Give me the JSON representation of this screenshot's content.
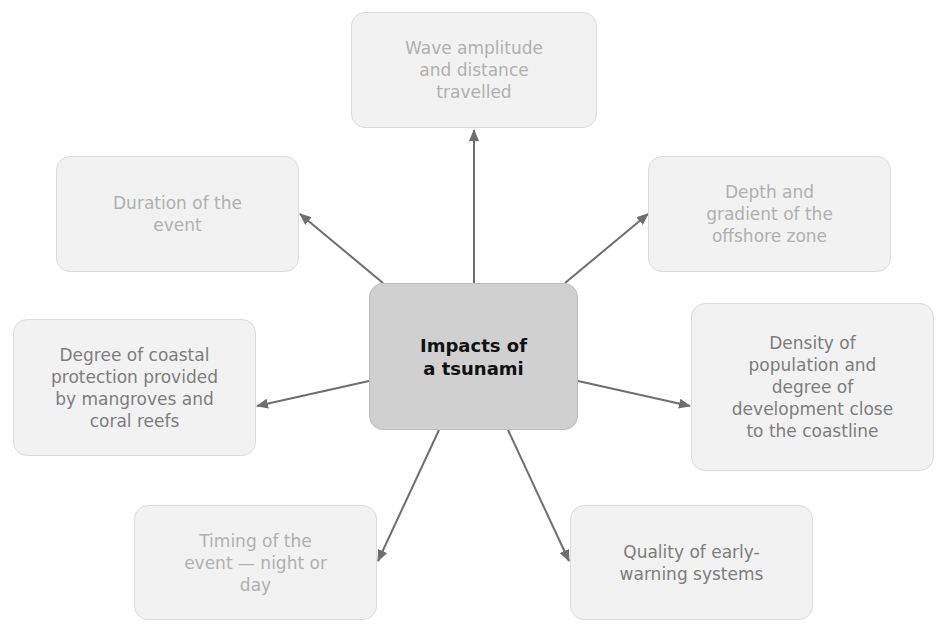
{
  "diagram": {
    "type": "spider-diagram",
    "center": {
      "label": "Impacts of\na tsunami"
    },
    "nodes": [
      {
        "id": "wave",
        "label": "Wave amplitude\nand distance\ntravelled",
        "emphasis": "faint"
      },
      {
        "id": "duration",
        "label": "Duration of the\nevent",
        "emphasis": "faint"
      },
      {
        "id": "depth",
        "label": "Depth and\ngradient of the\noffshore zone",
        "emphasis": "faint"
      },
      {
        "id": "coastal",
        "label": "Degree of coastal\nprotection provided\nby mangroves and\ncoral reefs",
        "emphasis": "mid"
      },
      {
        "id": "density",
        "label": "Density of\npopulation and\ndegree of\ndevelopment close\nto the coastline",
        "emphasis": "mid"
      },
      {
        "id": "timing",
        "label": "Timing of the\nevent — night or\nday",
        "emphasis": "faint"
      },
      {
        "id": "warning",
        "label": "Quality of early-\nwarning systems",
        "emphasis": "mid"
      }
    ],
    "edges": [
      {
        "from": "center",
        "to": "wave"
      },
      {
        "from": "center",
        "to": "duration"
      },
      {
        "from": "center",
        "to": "depth"
      },
      {
        "from": "center",
        "to": "coastal"
      },
      {
        "from": "center",
        "to": "density"
      },
      {
        "from": "center",
        "to": "timing"
      },
      {
        "from": "center",
        "to": "warning"
      }
    ],
    "colors": {
      "arrow": "#6e6e6e",
      "center_fill": "#d0d0d0",
      "node_fill": "#f2f2f2"
    }
  }
}
